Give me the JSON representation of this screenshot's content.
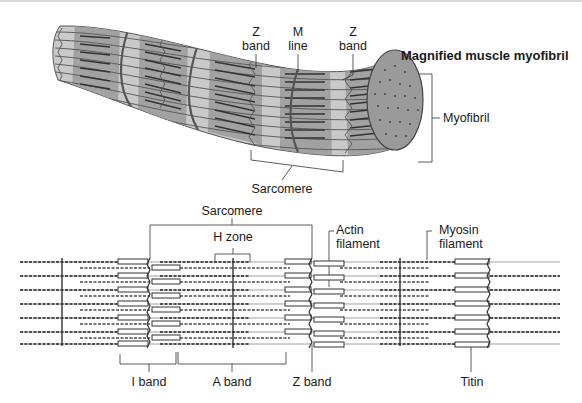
{
  "diagram": {
    "title": "Magnified muscle myofibril",
    "top_panel": {
      "labels": {
        "z_band_left_1": "Z",
        "z_band_left_2": "band",
        "m_line_1": "M",
        "m_line_2": "line",
        "z_band_right_1": "Z",
        "z_band_right_2": "band",
        "myofibril": "Myofibril",
        "sarcomere": "Sarcomere"
      }
    },
    "bottom_panel": {
      "labels": {
        "sarcomere": "Sarcomere",
        "h_zone": "H zone",
        "actin_1": "Actin",
        "actin_2": "filament",
        "myosin_1": "Myosin",
        "myosin_2": "filament",
        "i_band": "I band",
        "a_band": "A band",
        "z_band": "Z band",
        "titin": "Titin"
      }
    },
    "colors": {
      "fiber_light": "#c8c8c8",
      "fiber_dark": "#8a8a8a",
      "line": "#444444",
      "end_cap": "#9a9a9a"
    }
  }
}
